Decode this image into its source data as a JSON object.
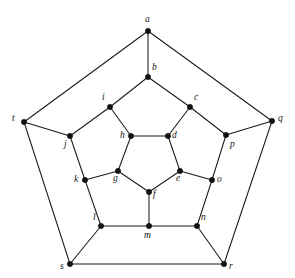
{
  "figure": {
    "background_color": "#ffffff",
    "edge_color": "#1a1a1a",
    "vertex_color": "#111111",
    "label_color": "#141414",
    "width": 295,
    "height": 278
  },
  "graph_data": {
    "type": "graph",
    "layout": "planar-concentric-pentagons",
    "vertex_count": 20,
    "edge_count": 30,
    "degree": 3,
    "vertices": [
      {
        "id": "a",
        "label": "a",
        "x": 148,
        "y": 31,
        "label_x": 145,
        "label_y": 15,
        "ring": "outer-top"
      },
      {
        "id": "b",
        "label": "b",
        "x": 148,
        "y": 77,
        "label_x": 152,
        "label_y": 63,
        "ring": "middle"
      },
      {
        "id": "c",
        "label": "c",
        "x": 190,
        "y": 107,
        "label_x": 194,
        "label_y": 93,
        "ring": "middle"
      },
      {
        "id": "d",
        "label": "d",
        "x": 168,
        "y": 136,
        "label_x": 172,
        "label_y": 131,
        "ring": "inner"
      },
      {
        "id": "e",
        "label": "e",
        "x": 180,
        "y": 171,
        "label_x": 176,
        "label_y": 174,
        "ring": "inner"
      },
      {
        "id": "f",
        "label": "f",
        "x": 149,
        "y": 192,
        "label_x": 153,
        "label_y": 190,
        "ring": "inner"
      },
      {
        "id": "g",
        "label": "g",
        "x": 118,
        "y": 171,
        "label_x": 113,
        "label_y": 174,
        "ring": "inner"
      },
      {
        "id": "h",
        "label": "h",
        "x": 131,
        "y": 136,
        "label_x": 120,
        "label_y": 131,
        "ring": "inner"
      },
      {
        "id": "i",
        "label": "i",
        "x": 110,
        "y": 107,
        "label_x": 102,
        "label_y": 93,
        "ring": "middle"
      },
      {
        "id": "j",
        "label": "j",
        "x": 70,
        "y": 136,
        "label_x": 64,
        "label_y": 140,
        "ring": "middle"
      },
      {
        "id": "k",
        "label": "k",
        "x": 85,
        "y": 180,
        "label_x": 74,
        "label_y": 175,
        "ring": "middle"
      },
      {
        "id": "l",
        "label": "l",
        "x": 101,
        "y": 226,
        "label_x": 93,
        "label_y": 213,
        "ring": "middle"
      },
      {
        "id": "m",
        "label": "m",
        "x": 149,
        "y": 226,
        "label_x": 144,
        "label_y": 231,
        "ring": "middle"
      },
      {
        "id": "n",
        "label": "n",
        "x": 197,
        "y": 226,
        "label_x": 201,
        "label_y": 213,
        "ring": "middle"
      },
      {
        "id": "o",
        "label": "o",
        "x": 212,
        "y": 180,
        "label_x": 217,
        "label_y": 175,
        "ring": "middle"
      },
      {
        "id": "p",
        "label": "p",
        "x": 226,
        "y": 135,
        "label_x": 230,
        "label_y": 140,
        "ring": "middle"
      },
      {
        "id": "q",
        "label": "q",
        "x": 272,
        "y": 121,
        "label_x": 278,
        "label_y": 114,
        "ring": "outer"
      },
      {
        "id": "r",
        "label": "r",
        "x": 224,
        "y": 264,
        "label_x": 229,
        "label_y": 262,
        "ring": "outer"
      },
      {
        "id": "s",
        "label": "s",
        "x": 70,
        "y": 264,
        "label_x": 60,
        "label_y": 262,
        "ring": "outer"
      },
      {
        "id": "t",
        "label": "t",
        "x": 24,
        "y": 122,
        "label_x": 12,
        "label_y": 114,
        "ring": "outer"
      }
    ],
    "edges": [
      [
        "a",
        "b"
      ],
      [
        "a",
        "t"
      ],
      [
        "a",
        "q"
      ],
      [
        "b",
        "i"
      ],
      [
        "b",
        "c"
      ],
      [
        "c",
        "d"
      ],
      [
        "c",
        "p"
      ],
      [
        "d",
        "h"
      ],
      [
        "d",
        "e"
      ],
      [
        "e",
        "f"
      ],
      [
        "e",
        "o"
      ],
      [
        "f",
        "g"
      ],
      [
        "f",
        "m"
      ],
      [
        "g",
        "h"
      ],
      [
        "g",
        "k"
      ],
      [
        "h",
        "i"
      ],
      [
        "i",
        "j"
      ],
      [
        "j",
        "t"
      ],
      [
        "j",
        "k"
      ],
      [
        "k",
        "l"
      ],
      [
        "l",
        "m"
      ],
      [
        "l",
        "s"
      ],
      [
        "m",
        "n"
      ],
      [
        "n",
        "o"
      ],
      [
        "n",
        "r"
      ],
      [
        "o",
        "p"
      ],
      [
        "p",
        "q"
      ],
      [
        "q",
        "r"
      ],
      [
        "r",
        "s"
      ],
      [
        "s",
        "t"
      ]
    ]
  }
}
